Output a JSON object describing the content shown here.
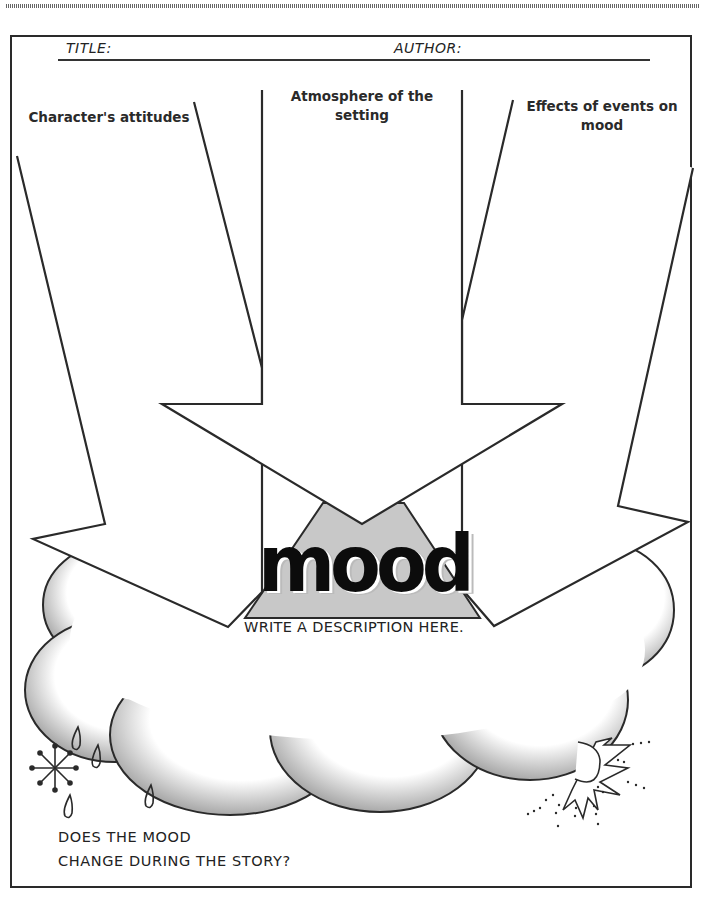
{
  "worksheet": {
    "header": {
      "title_label": "TITLE:",
      "author_label": "AUTHOR:"
    },
    "prompts": [
      {
        "id": "left",
        "label": "Character's attitudes"
      },
      {
        "id": "center",
        "label_line1": "Atmosphere of the",
        "label_line2": "setting"
      },
      {
        "id": "right",
        "label_line1": "Effects of events on",
        "label_line2": "mood"
      }
    ],
    "center": {
      "heading": "mood",
      "instruction": "WRITE A DESCRIPTION HERE."
    },
    "footer_question": {
      "line1": "DOES THE MOOD",
      "line2": "CHANGE DURING THE STORY?"
    },
    "icons": [
      "snowflake-icon",
      "raindrop-icon",
      "sun-icon",
      "cloud-icon",
      "arrow-icon"
    ]
  }
}
